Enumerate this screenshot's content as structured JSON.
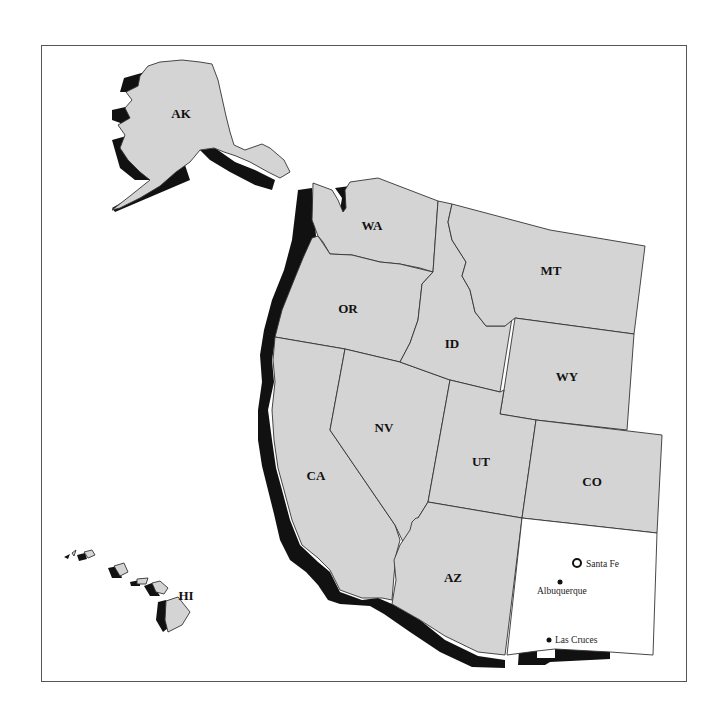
{
  "map": {
    "region": "Western United States",
    "highlighted_state": "NM",
    "colors": {
      "state_fill": "#d4d4d4",
      "highlight_fill": "#ffffff",
      "shadow": "#111111",
      "border": "#333333"
    },
    "states": [
      {
        "code": "AK",
        "label": "AK"
      },
      {
        "code": "HI",
        "label": "HI"
      },
      {
        "code": "WA",
        "label": "WA"
      },
      {
        "code": "OR",
        "label": "OR"
      },
      {
        "code": "CA",
        "label": "CA"
      },
      {
        "code": "NV",
        "label": "NV"
      },
      {
        "code": "ID",
        "label": "ID"
      },
      {
        "code": "MT",
        "label": "MT"
      },
      {
        "code": "WY",
        "label": "WY"
      },
      {
        "code": "UT",
        "label": "UT"
      },
      {
        "code": "CO",
        "label": "CO"
      },
      {
        "code": "AZ",
        "label": "AZ"
      }
    ],
    "cities": [
      {
        "name": "Santa Fe",
        "type": "capital",
        "icon": "star-circle-icon"
      },
      {
        "name": "Albuquerque",
        "type": "city",
        "icon": "dot-icon"
      },
      {
        "name": "Las Cruces",
        "type": "city",
        "icon": "dot-icon"
      }
    ]
  }
}
